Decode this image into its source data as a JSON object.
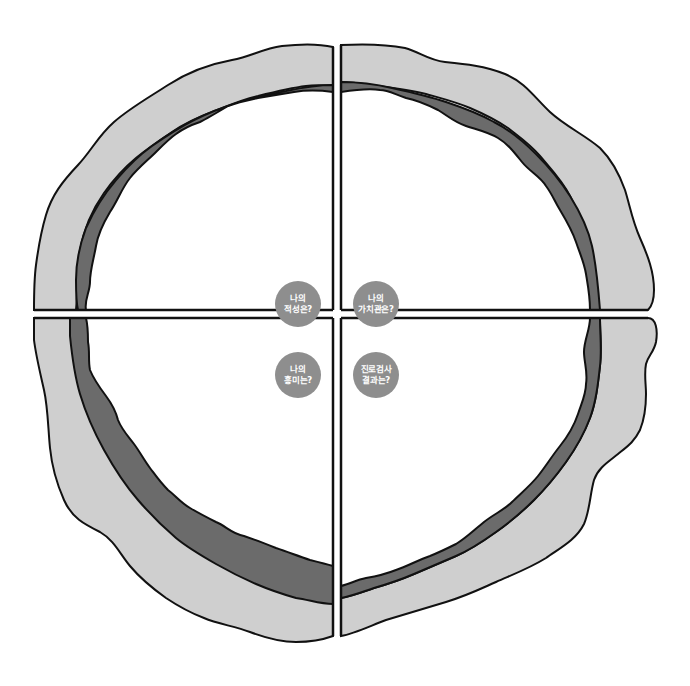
{
  "diagram": {
    "type": "four-quadrant-ring",
    "colors": {
      "outer_band": "#cfcfcf",
      "inner_band": "#6b6b6b",
      "outline": "#111111",
      "badge": "#8e8e8e",
      "badge_text": "#ffffff",
      "background": "#ffffff"
    },
    "quadrants": [
      {
        "position": "top-left",
        "badge": {
          "line1": "나의",
          "line2": "적성은?"
        }
      },
      {
        "position": "top-right",
        "badge": {
          "line1": "나의",
          "line2": "가치관은?"
        }
      },
      {
        "position": "bottom-left",
        "badge": {
          "line1": "나의",
          "line2": "흥미는?"
        }
      },
      {
        "position": "bottom-right",
        "badge": {
          "line1": "진로검사",
          "line2": "결과는?"
        }
      }
    ]
  }
}
